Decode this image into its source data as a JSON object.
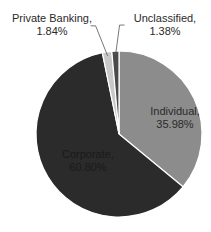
{
  "chart_data": {
    "type": "pie",
    "title": "",
    "categories": [
      "Individual",
      "Corporate",
      "Private Banking",
      "Unclassified"
    ],
    "values": [
      35.98,
      60.8,
      1.84,
      1.38
    ],
    "unit": "%",
    "labels": [
      {
        "name": "Individual,",
        "value": "35.98%"
      },
      {
        "name": "Corporate,",
        "value": "60.80%"
      },
      {
        "name": "Private Banking,",
        "value": "1.84%"
      },
      {
        "name": "Unclassified,",
        "value": "1.38%"
      }
    ],
    "colors": [
      "#8c8c8c",
      "#2b2b2b",
      "#c8c8c8",
      "#4a4a4a"
    ],
    "start_angle_deg": 0,
    "direction": "clockwise",
    "legend": "none",
    "label_position": "inside for large slices, outside with leader lines for small slices"
  }
}
